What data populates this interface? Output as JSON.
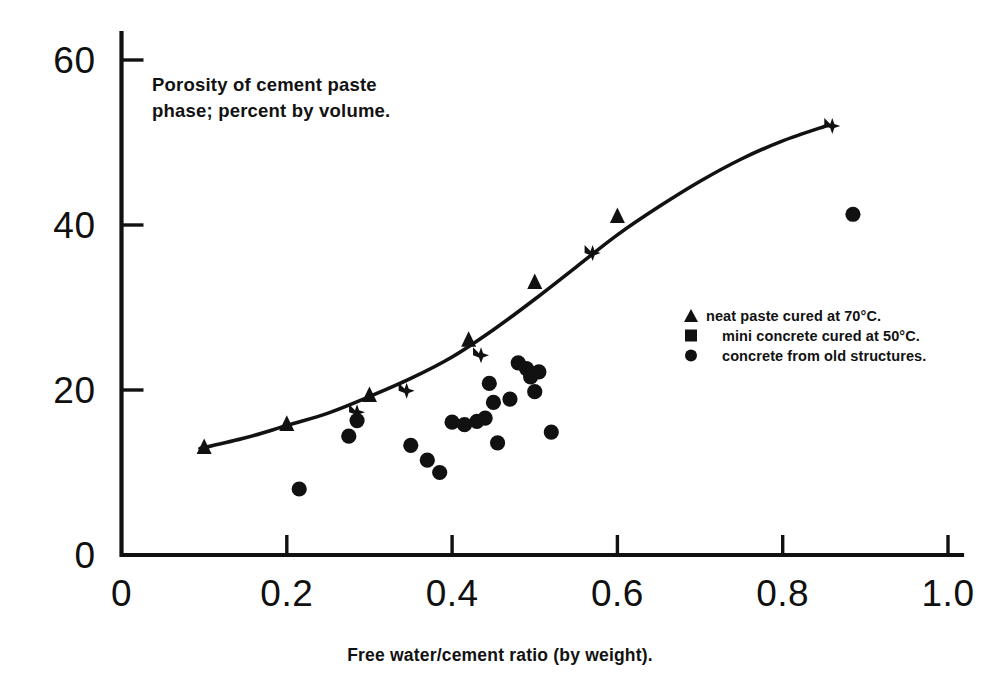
{
  "chart_data": {
    "type": "scatter",
    "title": "",
    "xlabel": "Free water/cement ratio (by weight).",
    "ylabel": "Porosity of cement paste phase; percent by volume.",
    "xlim": [
      0,
      1.0
    ],
    "ylim": [
      0,
      65
    ],
    "xticks": [
      "0",
      "0.2",
      "0.4",
      "0.6",
      "0.8",
      "1.0"
    ],
    "xtick_values": [
      0,
      0.2,
      0.4,
      0.6,
      0.8,
      1.0
    ],
    "yticks": [
      "0",
      "20",
      "40",
      "60"
    ],
    "ytick_values": [
      0,
      20,
      40,
      60
    ],
    "grid": false,
    "legend_position": "center-right",
    "series": [
      {
        "name": "neat paste cured at 70°C.",
        "marker": "triangle",
        "color": "#111111",
        "points": [
          {
            "x": 0.1,
            "y": 13.0
          },
          {
            "x": 0.2,
            "y": 15.8
          },
          {
            "x": 0.3,
            "y": 19.3
          },
          {
            "x": 0.42,
            "y": 26.0
          },
          {
            "x": 0.5,
            "y": 33.0
          },
          {
            "x": 0.6,
            "y": 41.0
          }
        ]
      },
      {
        "name": "mini concrete cured at 50°C.",
        "marker": "square",
        "color": "#111111",
        "points": [
          {
            "x": 0.285,
            "y": 17.3
          },
          {
            "x": 0.345,
            "y": 19.9
          },
          {
            "x": 0.435,
            "y": 24.2
          },
          {
            "x": 0.57,
            "y": 36.6
          },
          {
            "x": 0.86,
            "y": 52.0
          }
        ]
      },
      {
        "name": "concrete from old structures.",
        "marker": "circle",
        "color": "#111111",
        "points": [
          {
            "x": 0.215,
            "y": 8.0
          },
          {
            "x": 0.275,
            "y": 14.4
          },
          {
            "x": 0.285,
            "y": 16.3
          },
          {
            "x": 0.35,
            "y": 13.3
          },
          {
            "x": 0.37,
            "y": 11.5
          },
          {
            "x": 0.385,
            "y": 10.0
          },
          {
            "x": 0.4,
            "y": 16.1
          },
          {
            "x": 0.415,
            "y": 15.8
          },
          {
            "x": 0.43,
            "y": 16.2
          },
          {
            "x": 0.44,
            "y": 16.6
          },
          {
            "x": 0.445,
            "y": 20.8
          },
          {
            "x": 0.45,
            "y": 18.5
          },
          {
            "x": 0.455,
            "y": 13.6
          },
          {
            "x": 0.47,
            "y": 18.9
          },
          {
            "x": 0.48,
            "y": 23.3
          },
          {
            "x": 0.49,
            "y": 22.6
          },
          {
            "x": 0.495,
            "y": 21.6
          },
          {
            "x": 0.5,
            "y": 19.8
          },
          {
            "x": 0.505,
            "y": 22.2
          },
          {
            "x": 0.52,
            "y": 14.9
          },
          {
            "x": 0.885,
            "y": 41.3
          }
        ]
      }
    ],
    "fit_curve": {
      "name": "trend-line",
      "points": [
        {
          "x": 0.095,
          "y": 12.9
        },
        {
          "x": 0.15,
          "y": 14.2
        },
        {
          "x": 0.2,
          "y": 15.7
        },
        {
          "x": 0.25,
          "y": 17.2
        },
        {
          "x": 0.3,
          "y": 19.2
        },
        {
          "x": 0.35,
          "y": 21.4
        },
        {
          "x": 0.4,
          "y": 24.0
        },
        {
          "x": 0.45,
          "y": 27.3
        },
        {
          "x": 0.5,
          "y": 31.0
        },
        {
          "x": 0.55,
          "y": 34.9
        },
        {
          "x": 0.6,
          "y": 38.8
        },
        {
          "x": 0.65,
          "y": 42.2
        },
        {
          "x": 0.7,
          "y": 45.3
        },
        {
          "x": 0.75,
          "y": 48.0
        },
        {
          "x": 0.8,
          "y": 50.2
        },
        {
          "x": 0.855,
          "y": 52.1
        }
      ]
    }
  },
  "axes": {
    "y_caption_line1": "Porosity of cement paste",
    "y_caption_line2": "phase; percent by volume.",
    "x_caption": "Free water/cement ratio (by weight).",
    "xtick_labels": [
      "0",
      "0.2",
      "0.4",
      "0.6",
      "0.8",
      "1.0"
    ],
    "ytick_labels": [
      "0",
      "20",
      "40",
      "60"
    ]
  },
  "legend": {
    "items": [
      {
        "symbol": "triangle-marker",
        "label": "neat paste cured at 70°C."
      },
      {
        "symbol": "square-marker",
        "label": "mini concrete cured at 50°C."
      },
      {
        "symbol": "circle-marker",
        "label": "concrete from old structures."
      }
    ]
  },
  "colors": {
    "ink": "#111111",
    "background": "#ffffff"
  }
}
